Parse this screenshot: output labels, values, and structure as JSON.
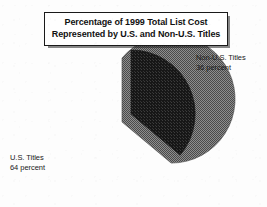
{
  "figure": {
    "background_color": "#ffffff",
    "title_box": {
      "border_color": "#1a1a1a",
      "shadow": true,
      "lines": [
        "Percentage of 1999 Total List Cost",
        "Represented by U.S. and Non-U.S. Titles"
      ]
    }
  },
  "labels": {
    "non_us": {
      "line1": "Non-U.S. Titles",
      "line2": "36 percent"
    },
    "us": {
      "line1": "U.S. Titles",
      "line2": "64 percent"
    }
  },
  "chart_data": {
    "type": "pie",
    "title": "Percentage of 1999 Total List Cost Represented by U.S. and Non-U.S. Titles",
    "xlabel": "",
    "ylabel": "",
    "units": "percent",
    "total": 100,
    "start_angle_deg": 0,
    "direction": "clockwise",
    "legend": "none",
    "grid": false,
    "categories": [
      "Non-U.S. Titles",
      "U.S. Titles"
    ],
    "values": [
      36,
      64
    ],
    "slices": [
      {
        "label": "Non-U.S. Titles",
        "value": 36,
        "value_text": "36 percent",
        "color": "#1f1f1f",
        "fill_style": "dark-halftone",
        "exploded": true,
        "start_angle_deg": 0,
        "end_angle_deg": 129.6
      },
      {
        "label": "U.S. Titles",
        "value": 64,
        "value_text": "64 percent",
        "color": "#6e6e6e",
        "fill_style": "medium-halftone",
        "exploded": false,
        "start_angle_deg": 129.6,
        "end_angle_deg": 360
      }
    ]
  }
}
